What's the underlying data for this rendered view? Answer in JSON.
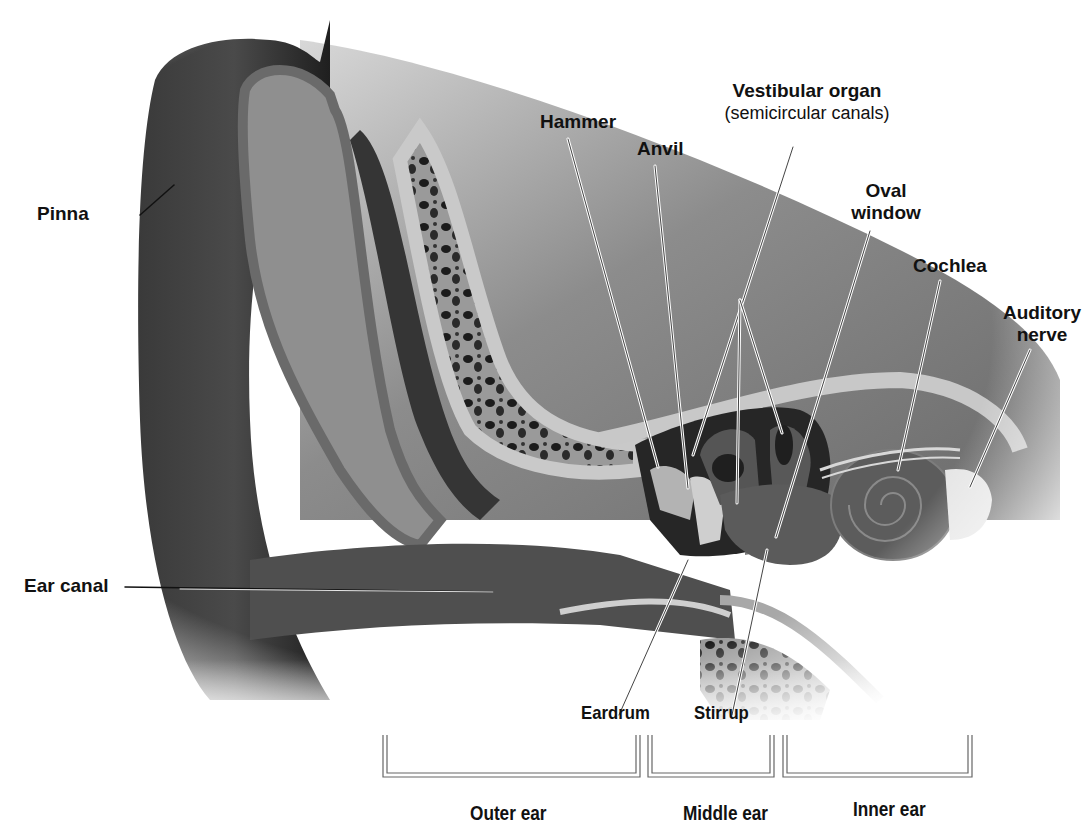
{
  "diagram": {
    "colors": {
      "background": "#ffffff",
      "pinna_dark": "#2a2a2a",
      "bone_light": "#bdbdbd",
      "bone_mid": "#8a8a8a",
      "tissue": "#6e6e6e",
      "spongy_bone_dark": "#1e1e1e",
      "cochlea": "#5a5a5a",
      "label_text": "#111111",
      "leader_line": "#f2f2f2"
    },
    "labels": {
      "pinna": "Pinna",
      "hammer": "Hammer",
      "anvil": "Anvil",
      "vestibular_title": "Vestibular organ",
      "vestibular_sub": "(semicircular canals)",
      "oval_1": "Oval",
      "oval_2": "window",
      "cochlea": "Cochlea",
      "auditory_1": "Auditory",
      "auditory_2": "nerve",
      "ear_canal": "Ear canal",
      "eardrum": "Eardrum",
      "stirrup": "Stirrup"
    },
    "regions": [
      {
        "id": "outer",
        "label": "Outer ear",
        "x_start": 375,
        "x_end": 600
      },
      {
        "id": "middle",
        "label": "Middle ear",
        "x_start": 606,
        "x_end": 708
      },
      {
        "id": "inner",
        "label": "Inner ear",
        "x_start": 715,
        "x_end": 888
      }
    ]
  }
}
